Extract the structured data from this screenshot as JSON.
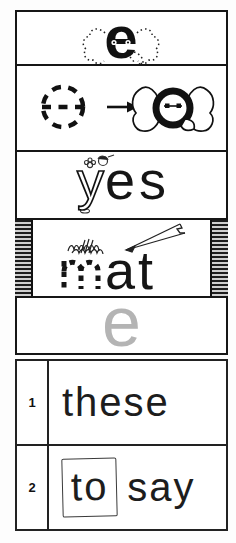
{
  "page": {
    "paper_color": "#ffffff",
    "ink_color": "#1a1a1a",
    "gray_letter_color": "#b4b4b4"
  },
  "sections": {
    "letter_card": {
      "letter": "e",
      "illustration": "elephant-ears-and-trunk-dotted-around-letter"
    },
    "trace_card": {
      "traced_letter": "e",
      "arrow": "right-arrow",
      "illustration": "elephant-face-with-ears"
    },
    "word_yes": {
      "outline_part": "y",
      "solid_part": "es",
      "illustration": "child-and-flower-doodle"
    },
    "word_mat": {
      "traced_part": "m",
      "solid_part": "at",
      "illustration": "pencil-scribbling"
    },
    "gray_letter": {
      "letter": "e"
    },
    "exercise_rows": [
      {
        "number": "1",
        "words": [
          {
            "text": "these",
            "boxed": false
          }
        ]
      },
      {
        "number": "2",
        "words": [
          {
            "text": "to",
            "boxed": true
          },
          {
            "text": "say",
            "boxed": false
          }
        ]
      }
    ]
  }
}
